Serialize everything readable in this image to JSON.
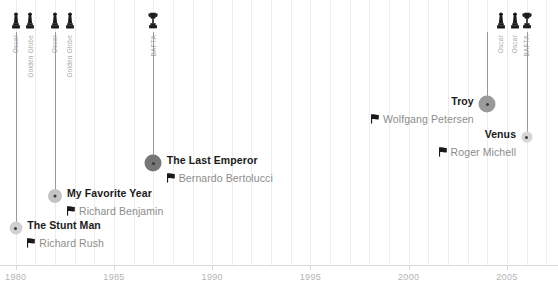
{
  "chart_data": {
    "type": "timeline",
    "title": "",
    "xlabel": "",
    "ylabel": "",
    "xlim": [
      1979.2,
      2007.6
    ],
    "grid": true,
    "legend": false,
    "tick_labels": [
      "1980",
      "1985",
      "1990",
      "1995",
      "2000",
      "2005"
    ],
    "tick_values": [
      1980,
      1985,
      1990,
      1995,
      2000,
      2005
    ],
    "entries": [
      {
        "title": "The Stunt Man",
        "director": "Richard Rush",
        "year": 1980,
        "align": "left",
        "marker_size": 13,
        "marker_color": "#d0d0d0"
      },
      {
        "title": "My Favorite Year",
        "director": "Richard Benjamin",
        "year": 1982,
        "align": "left",
        "marker_size": 14,
        "marker_color": "#c4c4c4"
      },
      {
        "title": "The Last Emperor",
        "director": "Bernardo Bertolucci",
        "year": 1987,
        "align": "left",
        "marker_size": 17,
        "marker_color": "#767676"
      },
      {
        "title": "Troy",
        "director": "Wolfgang Petersen",
        "year": 2004,
        "align": "right",
        "marker_size": 17,
        "marker_color": "#9a9a9a"
      },
      {
        "title": "Venus",
        "director": "Roger Michell",
        "year": 2006,
        "align": "right",
        "marker_size": 11,
        "marker_color": "#d6d6d6"
      }
    ],
    "awards": [
      {
        "label": "Oscar",
        "type": "oscar",
        "year": 1980.0
      },
      {
        "label": "Golden Globe",
        "type": "oscar",
        "year": 1980.75
      },
      {
        "label": "Oscar",
        "type": "oscar",
        "year": 1982.0
      },
      {
        "label": "Golden Globe",
        "type": "oscar",
        "year": 1982.75
      },
      {
        "label": "BAFTA",
        "type": "trophy",
        "year": 1987.0
      },
      {
        "label": "Oscar",
        "type": "oscar",
        "year": 2004.7
      },
      {
        "label": "Oscar",
        "type": "oscar",
        "year": 2005.4
      },
      {
        "label": "BAFTA",
        "type": "trophy",
        "year": 2006.0
      }
    ]
  },
  "colors": {
    "axis": "#d8d8d8",
    "grid": "#ededed",
    "stem": "#9a9a9a",
    "title_text": "#1a1a1a",
    "director_text": "#8c8c8c",
    "tick_text": "#b4b4b4",
    "award_text": "#a8a8a8",
    "icon": "#1a1a1a"
  }
}
